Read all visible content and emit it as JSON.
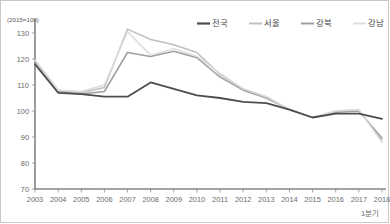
{
  "chart_data": {
    "type": "line",
    "title": "",
    "subtitle": "",
    "xlabel": "",
    "ylabel": "",
    "unit_note": "(2015=100)",
    "x_axis_last_sub_label": "1분기",
    "grid": false,
    "legend_position": "top-right",
    "ylim": [
      70,
      130
    ],
    "y_ticks": [
      70,
      80,
      90,
      100,
      110,
      120,
      130
    ],
    "categories": [
      "2003",
      "2004",
      "2005",
      "2006",
      "2007",
      "2008",
      "2009",
      "2010",
      "2011",
      "2012",
      "2013",
      "2014",
      "2015",
      "2016",
      "2017",
      "2018"
    ],
    "series": [
      {
        "name": "전국",
        "color": "#4d4d4d",
        "width": 1.8,
        "values": [
          118.0,
          107.0,
          106.5,
          105.5,
          105.5,
          111.0,
          108.5,
          106.0,
          105.0,
          103.5,
          103.0,
          100.5,
          97.5,
          99.0,
          99.0,
          97.0
        ]
      },
      {
        "name": "서울",
        "color": "#bfbfbf",
        "width": 1.5,
        "values": [
          119.5,
          108.0,
          107.0,
          109.0,
          131.5,
          127.5,
          125.5,
          122.5,
          114.0,
          108.5,
          105.5,
          100.5,
          97.5,
          100.0,
          100.5,
          88.5
        ]
      },
      {
        "name": "강북",
        "color": "#9e9e9e",
        "width": 1.5,
        "values": [
          119.0,
          107.5,
          106.5,
          107.5,
          122.5,
          121.0,
          123.0,
          120.5,
          113.0,
          108.0,
          105.0,
          100.5,
          97.5,
          99.5,
          100.0,
          89.5
        ]
      },
      {
        "name": "강남",
        "color": "#dcdcdc",
        "width": 1.5,
        "values": [
          119.5,
          108.0,
          107.5,
          110.0,
          130.5,
          121.5,
          124.0,
          121.0,
          114.5,
          108.5,
          105.5,
          100.5,
          97.5,
          100.0,
          100.5,
          88.0
        ]
      }
    ]
  },
  "legend": {
    "items": [
      {
        "label": "전국"
      },
      {
        "label": "서울"
      },
      {
        "label": "강북"
      },
      {
        "label": "강남"
      }
    ]
  }
}
